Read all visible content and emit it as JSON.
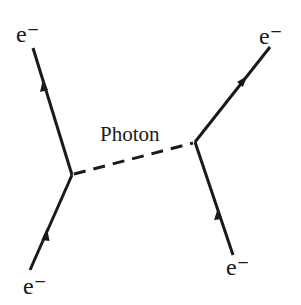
{
  "diagram": {
    "type": "feynman-diagram",
    "colors": {
      "line": "#1a1a1a",
      "background": "#ffffff"
    },
    "labels": {
      "incoming_left": "e⁻",
      "outgoing_left": "e⁻",
      "incoming_right": "e⁻",
      "outgoing_right": "e⁻",
      "propagator": "Photon"
    },
    "vertices": [
      {
        "name": "left-vertex",
        "x": 72,
        "y": 175
      },
      {
        "name": "right-vertex",
        "x": 195,
        "y": 142
      }
    ],
    "edges": [
      {
        "name": "incoming-electron-left",
        "style": "solid",
        "from": [
          30,
          270
        ],
        "to": [
          72,
          175
        ],
        "arrow": "forward"
      },
      {
        "name": "outgoing-electron-left",
        "style": "solid",
        "from": [
          72,
          175
        ],
        "to": [
          33,
          48
        ],
        "arrow": "forward"
      },
      {
        "name": "incoming-electron-right",
        "style": "solid",
        "from": [
          233,
          255
        ],
        "to": [
          195,
          142
        ],
        "arrow": "forward"
      },
      {
        "name": "outgoing-electron-right",
        "style": "solid",
        "from": [
          195,
          142
        ],
        "to": [
          270,
          47
        ],
        "arrow": "forward"
      },
      {
        "name": "photon-propagator",
        "style": "dashed",
        "from": [
          72,
          175
        ],
        "to": [
          195,
          142
        ],
        "arrow": "none"
      }
    ]
  }
}
